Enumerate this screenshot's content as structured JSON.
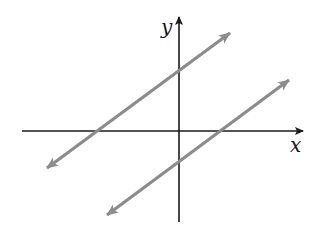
{
  "diagram": {
    "type": "coordinate-plane-parallel-lines",
    "axes": {
      "x_label": "x",
      "y_label": "y",
      "color": "#1a1a1a"
    },
    "lines": [
      {
        "name": "upper-line",
        "color": "#8c8c8c",
        "description": "Line with positive slope, positive y-intercept, negative x-intercept"
      },
      {
        "name": "lower-line",
        "color": "#8c8c8c",
        "description": "Line with positive slope, negative y-intercept, positive x-intercept"
      }
    ],
    "relationship": "The two lines are parallel (same slope)"
  }
}
